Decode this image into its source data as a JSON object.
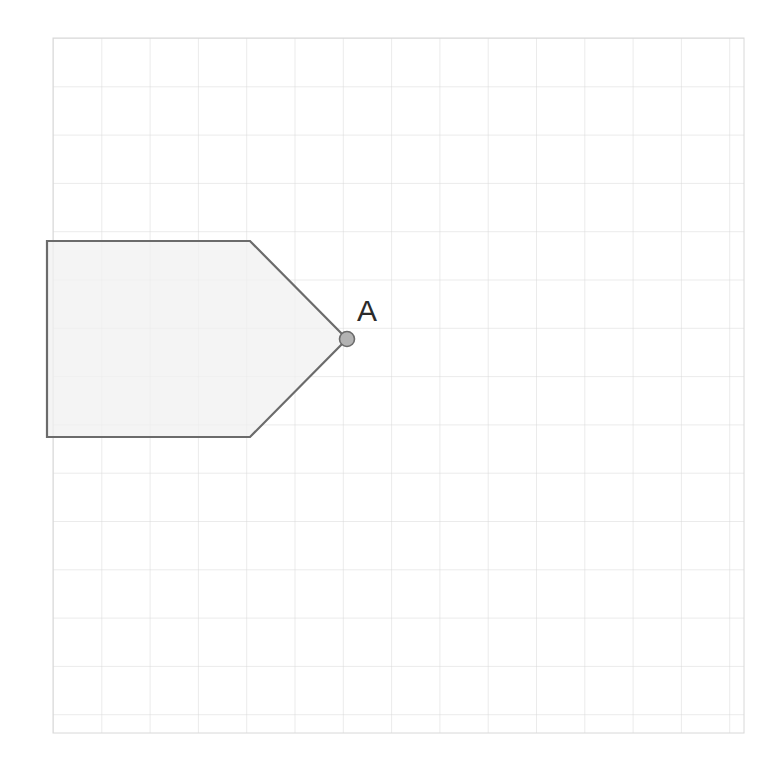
{
  "canvas": {
    "width": 784,
    "height": 771,
    "background": "#ffffff"
  },
  "grid": {
    "name": "coordinate-grid",
    "x": 53,
    "y": 38,
    "width": 691,
    "height": 695,
    "cell_size": 48.3,
    "columns": 14,
    "rows": 14,
    "line_color": "#d8d8d8",
    "line_width": 1,
    "border_color": "#d8d8d8"
  },
  "shape": {
    "name": "pentagon-arrow",
    "type": "polygon",
    "vertices": [
      {
        "x": 47,
        "y": 241
      },
      {
        "x": 250,
        "y": 241
      },
      {
        "x": 347,
        "y": 339
      },
      {
        "x": 250,
        "y": 437
      },
      {
        "x": 47,
        "y": 437
      }
    ],
    "fill": "#f0f0f0",
    "fill_opacity": 0.75,
    "stroke": "#6b6b6b",
    "stroke_width": 2.2
  },
  "points": [
    {
      "name": "point-a",
      "label": "A",
      "x": 347,
      "y": 339,
      "radius": 7.5,
      "fill": "#b3b3b3",
      "stroke": "#6b6b6b",
      "stroke_width": 1.6,
      "label_x": 357,
      "label_y": 321,
      "label_color": "#2b2b2b"
    }
  ]
}
